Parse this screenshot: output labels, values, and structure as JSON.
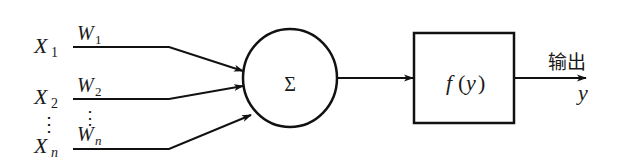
{
  "diagram": {
    "inputs": [
      {
        "var": "X",
        "sub": "1",
        "weight": "W",
        "weight_sub": "1"
      },
      {
        "var": "X",
        "sub": "2",
        "weight": "W",
        "weight_sub": "2"
      },
      {
        "var": "X",
        "sub": "n",
        "weight": "W",
        "weight_sub": "n"
      }
    ],
    "ellipsis": "⋮",
    "summation": {
      "symbol": "Σ"
    },
    "activation": {
      "f": "f",
      "open": "(",
      "arg": "y",
      "close": ")"
    },
    "output": {
      "label": "输出",
      "var": "y"
    },
    "colors": {
      "stroke": "#111111",
      "background": "#ffffff"
    }
  }
}
